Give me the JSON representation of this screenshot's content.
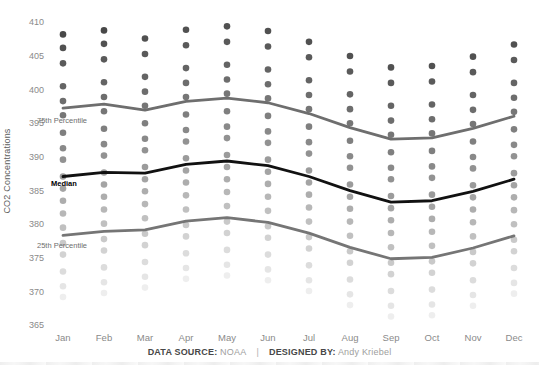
{
  "page": {
    "background": "#ffffff"
  },
  "footer": {
    "source_label": "DATA SOURCE:",
    "source_value": "NOAA",
    "separator": "|",
    "designer_label": "DESIGNED BY:",
    "designer_value": "Andy Kriebel"
  },
  "chart_data": {
    "type": "scatter",
    "title": "",
    "ylabel": "CO2 Concentrations",
    "grid": false,
    "legend": "none",
    "x_axis": {
      "categories": [
        "Jan",
        "Feb",
        "Mar",
        "Apr",
        "May",
        "Jun",
        "Jul",
        "Aug",
        "Sep",
        "Oct",
        "Nov",
        "Dec"
      ]
    },
    "y_axis": {
      "ticks": [
        410,
        405,
        400,
        395,
        390,
        385,
        380,
        375,
        370,
        365
      ],
      "min": 363.5,
      "max": 411.5,
      "unit": "ppm"
    },
    "years": {
      "first": 2000,
      "last_for_jan_feb": 2018,
      "last_for_mar_dec": 2017
    },
    "series": [
      {
        "month": "Jan",
        "start_year": 2000,
        "values": [
          369.2,
          370.8,
          373.0,
          375.5,
          377.2,
          379.5,
          381.6,
          383.5,
          385.3,
          387.1,
          389.6,
          391.3,
          393.6,
          396.2,
          398.3,
          400.5,
          403.9,
          406.2,
          408.2
        ]
      },
      {
        "month": "Feb",
        "start_year": 2000,
        "values": [
          369.8,
          371.4,
          373.6,
          376.1,
          377.8,
          380.1,
          382.2,
          384.1,
          385.9,
          387.7,
          390.2,
          391.9,
          394.2,
          396.8,
          398.9,
          401.1,
          404.5,
          406.8,
          408.8
        ]
      },
      {
        "month": "Mar",
        "start_year": 2000,
        "values": [
          370.6,
          372.2,
          374.4,
          376.9,
          378.6,
          380.9,
          383.0,
          384.9,
          386.7,
          388.5,
          391.0,
          392.7,
          395.0,
          397.6,
          399.7,
          401.9,
          405.3,
          407.6
        ]
      },
      {
        "month": "Apr",
        "start_year": 2000,
        "values": [
          371.9,
          373.5,
          375.7,
          378.2,
          379.9,
          382.2,
          384.3,
          386.2,
          388.0,
          389.8,
          392.3,
          394.0,
          396.3,
          398.9,
          401.0,
          403.2,
          406.6,
          408.9
        ]
      },
      {
        "month": "May",
        "start_year": 2000,
        "values": [
          372.4,
          374.0,
          376.2,
          378.7,
          380.4,
          382.7,
          384.8,
          386.7,
          388.5,
          390.3,
          392.8,
          394.5,
          396.8,
          399.4,
          401.5,
          403.7,
          407.1,
          409.4
        ]
      },
      {
        "month": "Jun",
        "start_year": 2000,
        "values": [
          371.7,
          373.3,
          375.5,
          378.0,
          379.7,
          382.0,
          384.1,
          386.0,
          387.8,
          389.6,
          392.1,
          393.8,
          396.1,
          398.7,
          400.8,
          403.0,
          406.4,
          408.7
        ]
      },
      {
        "month": "Jul",
        "start_year": 2000,
        "values": [
          370.1,
          371.7,
          373.9,
          376.4,
          378.1,
          380.4,
          382.5,
          384.4,
          386.2,
          388.0,
          390.5,
          392.2,
          394.5,
          397.1,
          399.2,
          401.4,
          404.8,
          407.1
        ]
      },
      {
        "month": "Aug",
        "start_year": 2000,
        "values": [
          368.0,
          369.6,
          371.8,
          374.3,
          376.0,
          378.3,
          380.4,
          382.3,
          384.1,
          385.9,
          388.4,
          390.1,
          392.4,
          395.0,
          397.1,
          399.3,
          402.7,
          405.0
        ]
      },
      {
        "month": "Sep",
        "start_year": 2000,
        "values": [
          366.3,
          367.9,
          370.1,
          372.6,
          374.3,
          376.6,
          378.7,
          380.6,
          382.4,
          384.2,
          386.7,
          388.4,
          390.7,
          393.3,
          395.4,
          397.6,
          401.0,
          403.3
        ]
      },
      {
        "month": "Oct",
        "start_year": 2000,
        "values": [
          366.5,
          368.1,
          370.3,
          372.8,
          374.5,
          376.8,
          378.9,
          380.8,
          382.6,
          384.4,
          386.9,
          388.6,
          390.9,
          393.5,
          395.6,
          397.8,
          401.2,
          403.5
        ]
      },
      {
        "month": "Nov",
        "start_year": 2000,
        "values": [
          367.9,
          369.5,
          371.7,
          374.2,
          375.9,
          378.2,
          380.3,
          382.2,
          384.0,
          385.8,
          388.3,
          390.0,
          392.3,
          394.9,
          397.0,
          399.2,
          402.6,
          404.9
        ]
      },
      {
        "month": "Dec",
        "start_year": 2000,
        "values": [
          369.7,
          371.3,
          373.5,
          376.0,
          377.7,
          380.0,
          382.1,
          384.0,
          385.8,
          387.6,
          390.1,
          391.8,
          394.1,
          396.7,
          398.8,
          401.0,
          404.4,
          406.7
        ]
      }
    ],
    "percentile_lines": {
      "p75": {
        "label": "75th Percentile",
        "values": [
          397.25,
          397.85,
          396.95,
          398.25,
          398.75,
          398.05,
          396.45,
          394.35,
          392.65,
          392.85,
          394.25,
          396.05
        ]
      },
      "median": {
        "label": "Median",
        "values": [
          387.1,
          387.7,
          387.6,
          388.9,
          389.4,
          388.7,
          387.1,
          385.0,
          383.3,
          383.5,
          384.9,
          386.7
        ]
      },
      "p25": {
        "label": "25th Percentile",
        "values": [
          378.35,
          378.95,
          379.18,
          380.48,
          380.98,
          380.28,
          378.68,
          376.58,
          374.88,
          375.08,
          376.48,
          378.28
        ]
      }
    },
    "colors": {
      "dot_oldest": "#EEEEEE",
      "dot_newest": "#484848",
      "p75_line": "#6e6e6e",
      "p25_line": "#757575",
      "median_line": "#111111",
      "tick_text": "#8a8a8a",
      "annotation_text": "#6e6e6e"
    }
  }
}
